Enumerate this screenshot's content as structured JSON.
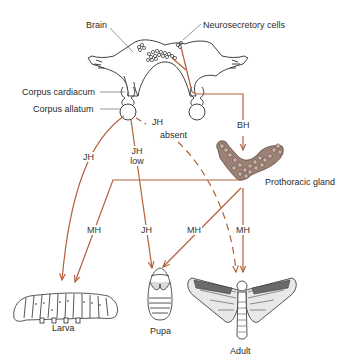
{
  "diagram": {
    "colors": {
      "hormone_arrow": "#b2603a",
      "outline": "#2b2b2b",
      "gland_fill": "#8a6e62"
    },
    "structures": {
      "brain": "Brain",
      "neurosecretory": "Neurosecretory cells",
      "corpus_cardiacum": "Corpus cardiacum",
      "corpus_allatum": "Corpus allatum",
      "prothoracic": "Prothoracic gland"
    },
    "hormones": {
      "jh_larva": "JH",
      "jh_low_1": "JH",
      "jh_low_2": "low",
      "jh_absent_1": "JH",
      "jh_absent_2": "absent",
      "bh": "BH",
      "mh_larva": "MH",
      "jh_pupa": "JH",
      "mh_pupa": "MH",
      "mh_adult": "MH"
    },
    "stages": {
      "larva": "Larva",
      "pupa": "Pupa",
      "adult": "Adult"
    }
  }
}
